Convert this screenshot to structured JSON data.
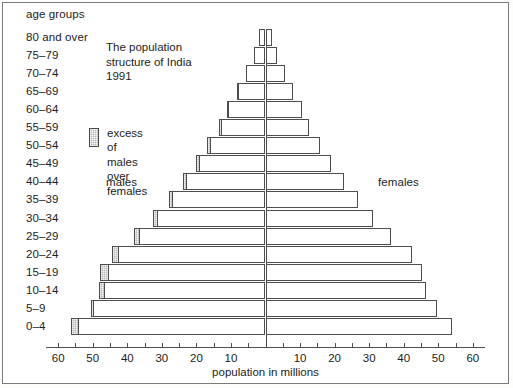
{
  "chart_data": {
    "type": "bar",
    "title": "The population\nstructure of India\n1991",
    "subtitle": "",
    "xlabel": "population in millions",
    "ylabel": "age groups",
    "orientation": "population-pyramid",
    "axis_ticks_left": [
      "60",
      "50",
      "40",
      "30",
      "20",
      "10"
    ],
    "axis_ticks_right": [
      "10",
      "20",
      "30",
      "40",
      "50",
      "60"
    ],
    "axis_max": 60,
    "grid": false,
    "legend_position": "upper-left-inside",
    "legend": [
      {
        "label": "excess of males\nover females",
        "color": "#b9b9b9"
      }
    ],
    "side_labels": {
      "left": "males",
      "right": "females"
    },
    "categories": [
      "80 and over",
      "75–79",
      "70–74",
      "65–69",
      "60–64",
      "55–59",
      "50–54",
      "45–49",
      "40–44",
      "35–39",
      "30–34",
      "25–29",
      "20–24",
      "15–19",
      "10–14",
      "5–9",
      "0–4"
    ],
    "series": [
      {
        "name": "males",
        "values": [
          2.0,
          3.4,
          5.6,
          8.3,
          11.2,
          13.6,
          17.0,
          20.2,
          24.0,
          28.0,
          32.5,
          38.0,
          44.5,
          47.8,
          48.2,
          50.6,
          56.4
        ]
      },
      {
        "name": "females",
        "values": [
          2.0,
          3.4,
          5.6,
          8.0,
          10.6,
          12.7,
          15.8,
          18.9,
          22.8,
          26.8,
          31.0,
          36.4,
          42.5,
          45.2,
          46.5,
          49.6,
          54.0
        ]
      },
      {
        "name": "excess of males over females",
        "values": [
          0.0,
          0.0,
          0.0,
          0.3,
          0.6,
          0.9,
          1.2,
          1.3,
          1.2,
          1.2,
          1.5,
          1.6,
          2.0,
          2.6,
          1.7,
          1.0,
          2.4
        ]
      }
    ]
  },
  "labels": {
    "age_groups_heading": "age groups",
    "males": "males",
    "females": "females"
  }
}
